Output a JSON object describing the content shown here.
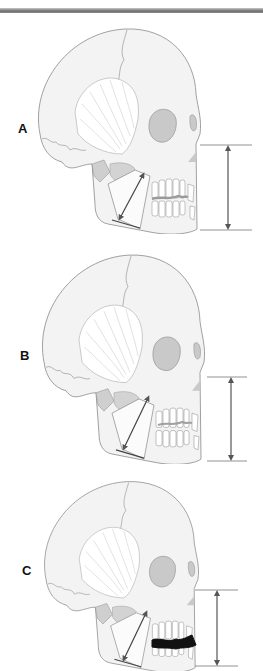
{
  "figure": {
    "panels": [
      {
        "label": "A",
        "description": "Lateral skull with normal vertical dimension"
      },
      {
        "label": "B",
        "description": "Lateral skull with increased anterior face height"
      },
      {
        "label": "C",
        "description": "Lateral skull with reduced vertical dimension and dark occlusal gap"
      }
    ]
  },
  "colors": {
    "bone": "#f4f4f4",
    "outline": "#8a8a8a",
    "orbit": "#c9c9c9",
    "arrow": "#555555",
    "gap_A": "#9a9a9a",
    "gap_C": "#111111"
  }
}
